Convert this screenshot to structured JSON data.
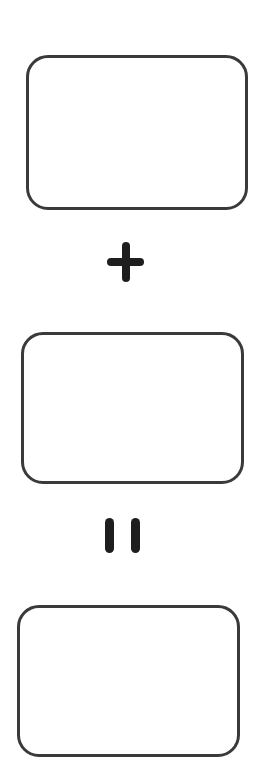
{
  "diagram": {
    "type": "equation-template",
    "stroke_color": "#3a3a3a",
    "symbol_color": "#1e1e1e",
    "background": "#ffffff",
    "elements": [
      {
        "kind": "box",
        "name": "first-addend-box",
        "content": ""
      },
      {
        "kind": "operator",
        "name": "plus-sign",
        "symbol": "+"
      },
      {
        "kind": "box",
        "name": "second-addend-box",
        "content": ""
      },
      {
        "kind": "operator",
        "name": "equals-sign",
        "symbol": "="
      },
      {
        "kind": "box",
        "name": "sum-box",
        "content": ""
      }
    ]
  }
}
